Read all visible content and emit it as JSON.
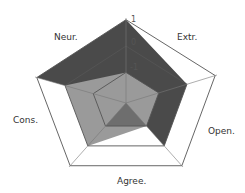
{
  "chart_data": {
    "type": "radar",
    "title": "",
    "axes": [
      "Neur.",
      "Extr.",
      "Open.",
      "Agree.",
      "Cons."
    ],
    "ticks": [
      "1",
      "0",
      "-1"
    ],
    "tick_values": [
      1,
      0,
      -1
    ],
    "range": [
      -2.16,
      1
    ],
    "series": [
      {
        "name": "Series 1",
        "color": "#4a4a4a",
        "values": [
          1,
          0,
          0,
          -2.16,
          1
        ]
      },
      {
        "name": "Series 2",
        "color": "#9a9a9a",
        "values": [
          -1,
          -1,
          -1,
          0,
          0
        ]
      },
      {
        "name": "Series 3",
        "color": "#6e6e6e",
        "values": [
          -2.16,
          -2.16,
          -1,
          -1,
          -2.16
        ]
      }
    ],
    "grid": true,
    "legend": "none"
  },
  "labels": {
    "neur": "Neur.",
    "extr": "Extr.",
    "open": "Open.",
    "agree": "Agree.",
    "cons": "Cons.",
    "tick_1": "1",
    "tick_0": "0",
    "tick_m1": "-1"
  }
}
